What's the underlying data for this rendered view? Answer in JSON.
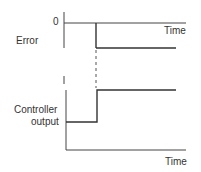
{
  "upper_plot": {
    "y_label": "Error",
    "zero_label": "0",
    "x_label": "Time"
  },
  "lower_plot": {
    "y_label_line1": "Controller",
    "y_label_line2": "output",
    "x_label": "Time"
  },
  "colors": {
    "line": "#333333",
    "background": "#ffffff"
  }
}
